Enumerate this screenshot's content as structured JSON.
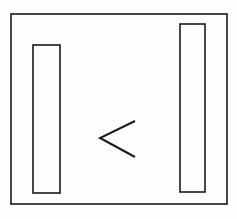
{
  "figure": {
    "description": "A large open rectangular frame containing two tall narrow vertical rectangles and a chevron mark pointing left",
    "background_color": "#fefefe",
    "stroke_color": "#1a1a1a",
    "canvas": {
      "width": 237,
      "height": 219
    },
    "shapes": [
      {
        "id": "outer-frame",
        "name": "outer-frame",
        "type": "rectangle",
        "x": 11,
        "y": 14,
        "width": 216,
        "height": 190,
        "stroke_width": 1.6,
        "fill": "none"
      },
      {
        "id": "left-bar",
        "name": "left-vertical-bar",
        "type": "rectangle",
        "x": 33,
        "y": 45,
        "width": 27,
        "height": 148,
        "stroke_width": 1.6,
        "fill": "none"
      },
      {
        "id": "right-bar",
        "name": "right-vertical-bar",
        "type": "rectangle",
        "x": 180,
        "y": 24,
        "width": 25,
        "height": 168,
        "stroke_width": 1.6,
        "fill": "none"
      },
      {
        "id": "chevron",
        "name": "chevron-left-mark",
        "type": "polyline",
        "points": "135,121 100,138 135,157",
        "stroke_width": 2.0,
        "fill": "none"
      }
    ]
  }
}
